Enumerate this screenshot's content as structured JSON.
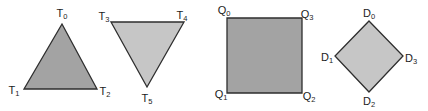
{
  "colors": {
    "stroke": "#2e2e2e",
    "fill_dark": "#a3a3a3",
    "fill_light": "#c6c6c6",
    "label": "#1c1c1c"
  },
  "shapes": [
    {
      "id": "triangle-up",
      "kind": "triangle",
      "fill": "#a3a3a3",
      "points": [
        [
          62,
          24
        ],
        [
          24,
          89
        ],
        [
          97,
          89
        ]
      ],
      "vertices": [
        {
          "base": "T",
          "sub": "0",
          "x": 62,
          "y": 13
        },
        {
          "base": "T",
          "sub": "1",
          "x": 14,
          "y": 90
        },
        {
          "base": "T",
          "sub": "2",
          "x": 105,
          "y": 91
        }
      ]
    },
    {
      "id": "triangle-down",
      "kind": "triangle",
      "fill": "#c6c6c6",
      "points": [
        [
          111,
          22
        ],
        [
          184,
          22
        ],
        [
          147,
          87
        ]
      ],
      "vertices": [
        {
          "base": "T",
          "sub": "3",
          "x": 104,
          "y": 16
        },
        {
          "base": "T",
          "sub": "4",
          "x": 182,
          "y": 15
        },
        {
          "base": "T",
          "sub": "5",
          "x": 147,
          "y": 98
        }
      ]
    },
    {
      "id": "square",
      "kind": "quad",
      "fill": "#a3a3a3",
      "points": [
        [
          227,
          18
        ],
        [
          302,
          18
        ],
        [
          302,
          93
        ],
        [
          227,
          93
        ]
      ],
      "vertices": [
        {
          "base": "Q",
          "sub": "0",
          "x": 224,
          "y": 10
        },
        {
          "base": "Q",
          "sub": "3",
          "x": 307,
          "y": 14
        },
        {
          "base": "Q",
          "sub": "1",
          "x": 221,
          "y": 94
        },
        {
          "base": "Q",
          "sub": "2",
          "x": 309,
          "y": 96
        }
      ]
    },
    {
      "id": "diamond",
      "kind": "quad",
      "fill": "#c6c6c6",
      "points": [
        [
          369,
          21
        ],
        [
          403,
          56
        ],
        [
          369,
          92
        ],
        [
          335,
          56
        ]
      ],
      "vertices": [
        {
          "base": "D",
          "sub": "0",
          "x": 369,
          "y": 13
        },
        {
          "base": "D",
          "sub": "1",
          "x": 327,
          "y": 57
        },
        {
          "base": "D",
          "sub": "3",
          "x": 411,
          "y": 58
        },
        {
          "base": "D",
          "sub": "2",
          "x": 369,
          "y": 101
        }
      ]
    }
  ]
}
